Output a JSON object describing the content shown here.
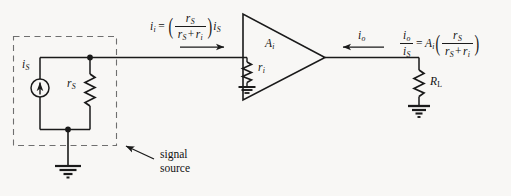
{
  "figure": {
    "kind": "circuit-schematic",
    "background_color": "#f8f7f5",
    "ink_color": "#1a1a1a"
  },
  "labels": {
    "source_current": {
      "symbol": "i",
      "subscript": "S"
    },
    "source_resistance": {
      "symbol": "r",
      "subscript": "S"
    },
    "input_resistance": {
      "symbol": "r",
      "subscript": "i"
    },
    "amplifier_gain": {
      "symbol": "A",
      "subscript": "i"
    },
    "output_current": {
      "symbol": "i",
      "subscript": "o"
    },
    "load_resistance": {
      "symbol": "R",
      "subscript": "L"
    },
    "annotation": "signal\nsource",
    "annotation_line1": "signal",
    "annotation_line2": "source"
  },
  "formulas": {
    "input": {
      "lhs_symbol": "i",
      "lhs_subscript": "i",
      "equals": "=",
      "numerator_symbol": "r",
      "numerator_subscript": "S",
      "denominator_left_symbol": "r",
      "denominator_left_subscript": "S",
      "denominator_plus": "+",
      "denominator_right_symbol": "r",
      "denominator_right_subscript": "i",
      "trailing_symbol": "i",
      "trailing_subscript": "S",
      "plain_text": "i_i = ( r_S / ( r_S + r_i ) ) i_S"
    },
    "output": {
      "lhs_numerator_symbol": "i",
      "lhs_numerator_subscript": "o",
      "lhs_denominator_symbol": "i",
      "lhs_denominator_subscript": "S",
      "equals": "=",
      "gain_symbol": "A",
      "gain_subscript": "i",
      "numerator_symbol": "r",
      "numerator_subscript": "S",
      "denominator_left_symbol": "r",
      "denominator_left_subscript": "S",
      "denominator_plus": "+",
      "denominator_right_symbol": "r",
      "denominator_right_subscript": "i",
      "plain_text": "i_o / i_S = A_i ( r_S / ( r_S + r_i ) )"
    }
  },
  "components": {
    "current_source": {
      "name": "is-current-source",
      "shape": "circle-with-up-arrow"
    },
    "resistor_rs": {
      "name": "rs-resistor",
      "shape": "zigzag-vertical"
    },
    "resistor_ri": {
      "name": "ri-resistor",
      "shape": "zigzag-vertical"
    },
    "resistor_rl": {
      "name": "rl-resistor",
      "shape": "zigzag-vertical"
    },
    "amplifier": {
      "name": "amplifier-triangle",
      "shape": "triangle-pointing-right"
    },
    "grounds": [
      "source-ground",
      "ri-ground",
      "load-ground"
    ],
    "dashed_box": {
      "name": "signal-source-boundary",
      "style": "dashed"
    },
    "arrows": [
      "input-current-arrow-right",
      "output-current-arrow-left",
      "annotation-pointer-arrow"
    ]
  }
}
